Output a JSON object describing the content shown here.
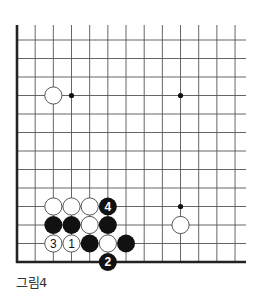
{
  "diagram": {
    "type": "go-board-fragment",
    "caption": "그림4",
    "grid": {
      "x0": 17,
      "dx": 18.17,
      "cols": 13,
      "y_bottom": 262,
      "dy": 18.5,
      "rows": 13,
      "top_y": 25,
      "right_x": 246,
      "line_color": "#555555",
      "edge_color": "#222222"
    },
    "hoshi": [
      {
        "col": 3,
        "row": 9
      },
      {
        "col": 9,
        "row": 9
      },
      {
        "col": 9,
        "row": 3
      }
    ],
    "stones": [
      {
        "color": "white",
        "col": 2,
        "row": 9,
        "label": ""
      },
      {
        "color": "white",
        "col": 9,
        "row": 2,
        "label": ""
      },
      {
        "color": "white",
        "col": 2,
        "row": 3,
        "label": ""
      },
      {
        "color": "white",
        "col": 3,
        "row": 3,
        "label": ""
      },
      {
        "color": "white",
        "col": 4,
        "row": 3,
        "label": ""
      },
      {
        "color": "black",
        "col": 5,
        "row": 3,
        "label": "4"
      },
      {
        "color": "black",
        "col": 2,
        "row": 2,
        "label": ""
      },
      {
        "color": "black",
        "col": 3,
        "row": 2,
        "label": ""
      },
      {
        "color": "white",
        "col": 4,
        "row": 2,
        "label": ""
      },
      {
        "color": "black",
        "col": 5,
        "row": 2,
        "label": ""
      },
      {
        "color": "white",
        "col": 2,
        "row": 1,
        "label": "3"
      },
      {
        "color": "white",
        "col": 3,
        "row": 1,
        "label": "1"
      },
      {
        "color": "black",
        "col": 4,
        "row": 1,
        "label": ""
      },
      {
        "color": "white",
        "col": 5,
        "row": 1,
        "label": ""
      },
      {
        "color": "black",
        "col": 6,
        "row": 1,
        "label": ""
      },
      {
        "color": "black",
        "col": 5,
        "row": 0,
        "label": "2"
      }
    ]
  }
}
